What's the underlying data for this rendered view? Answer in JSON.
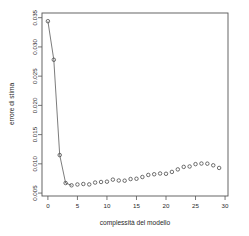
{
  "chart_data": {
    "type": "scatter",
    "title": "",
    "subtitle": "",
    "xlabel": "complessità del modello",
    "ylabel": "errore di stima",
    "xlim": [
      -1.0,
      30.5
    ],
    "ylim": [
      0.0045,
      0.0358
    ],
    "xticks": [
      0,
      5,
      10,
      15,
      20,
      25,
      30
    ],
    "xtick_labels": [
      "0",
      "5",
      "10",
      "15",
      "20",
      "25",
      "30"
    ],
    "yticks": [
      0.005,
      0.01,
      0.015,
      0.02,
      0.025,
      0.03,
      0.035
    ],
    "ytick_labels": [
      "0.005",
      "0.010",
      "0.015",
      "0.020",
      "0.025",
      "0.030",
      "0.035"
    ],
    "grid": false,
    "legend": null,
    "legend_position": "none",
    "marker": "open-circle",
    "line_connects_first_points": true,
    "x": [
      0,
      1,
      2,
      3,
      4,
      5,
      6,
      7,
      8,
      9,
      10,
      11,
      12,
      13,
      14,
      15,
      16,
      17,
      18,
      19,
      20,
      21,
      22,
      23,
      24,
      25,
      26,
      27,
      28,
      29
    ],
    "values": [
      0.0344,
      0.0278,
      0.0115,
      0.00672,
      0.00633,
      0.00647,
      0.00655,
      0.00648,
      0.0068,
      0.0069,
      0.00695,
      0.0073,
      0.00715,
      0.00712,
      0.0074,
      0.00745,
      0.00775,
      0.0081,
      0.00822,
      0.00835,
      0.0083,
      0.00862,
      0.00905,
      0.00948,
      0.00955,
      0.00995,
      0.01005,
      0.01003,
      0.00975,
      0.0093
    ],
    "series": [
      {
        "name": "errore di stima",
        "values": [
          0.0344,
          0.0278,
          0.0115,
          0.00672,
          0.00633,
          0.00647,
          0.00655,
          0.00648,
          0.0068,
          0.0069,
          0.00695,
          0.0073,
          0.00715,
          0.00712,
          0.0074,
          0.00745,
          0.00775,
          0.0081,
          0.00822,
          0.00835,
          0.0083,
          0.00862,
          0.00905,
          0.00948,
          0.00955,
          0.00995,
          0.01005,
          0.01003,
          0.00975,
          0.0093
        ]
      }
    ],
    "colors": {
      "marker_stroke": "#4a4a4a",
      "line": "#5a5a5a",
      "axis": "#555555",
      "background": "#ffffff",
      "text": "#1f1f1f"
    },
    "plot_area_px": {
      "left": 42,
      "top": 13,
      "right": 228,
      "bottom": 196
    }
  }
}
